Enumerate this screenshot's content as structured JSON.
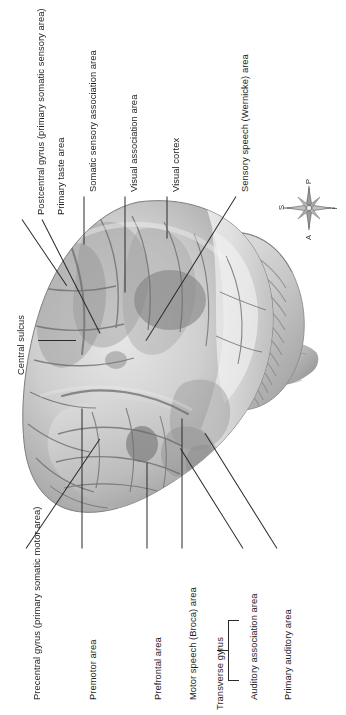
{
  "figure": {
    "orientation": "rotated-90",
    "background_color": "#ffffff",
    "ink_color": "#1c1c1c"
  },
  "labels": {
    "central_sulcus": "Central sulcus",
    "postcentral_gyrus": "Postcentral gyrus (primary somatic sensory area)",
    "primary_taste_area": "Primary taste area",
    "somatic_sensory_association_area": "Somatic sensory association area",
    "visual_association_area": "Visual association area",
    "visual_cortex": "Visual cortex",
    "sensory_speech_wernicke_area": "Sensory speech (Wernicke) area",
    "precentral_gyrus": "Precentral gyrus (primary somatic motor area)",
    "premotor_area": "Premotor area",
    "prefrontal_area": "Prefrontal area",
    "motor_speech_broca_area": "Motor speech (Broca) area",
    "auditory_association_area": "Auditory association area",
    "primary_auditory_area": "Primary auditory area",
    "transverse_gyrus": "Transverse gyrus"
  },
  "compass": {
    "name": "orientation-compass-rose",
    "superior": "S",
    "posterior": "P",
    "anterior": "A",
    "inferior": "I"
  },
  "anatomy": {
    "cerebrum": "cerebrum",
    "cerebellum": "cerebellum",
    "brainstem": "brainstem"
  }
}
